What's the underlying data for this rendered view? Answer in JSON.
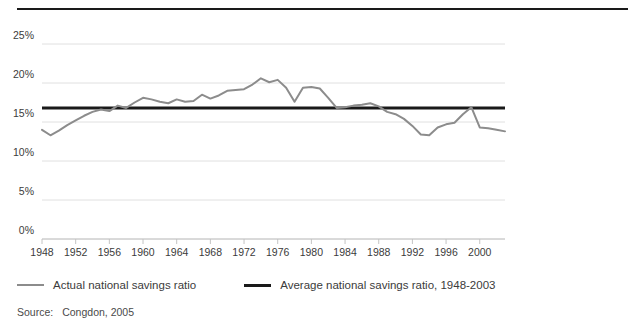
{
  "chart_data": {
    "type": "line",
    "title": "",
    "xlabel": "",
    "ylabel": "",
    "xlim": [
      1948,
      2003
    ],
    "ylim": [
      0,
      25
    ],
    "grid": true,
    "legend_position": "below",
    "y_ticks": [
      "0%",
      "5%",
      "10%",
      "15%",
      "20%",
      "25%"
    ],
    "y_tick_values": [
      0,
      5,
      10,
      15,
      20,
      25
    ],
    "x_ticks": [
      "1948",
      "1952",
      "1956",
      "1960",
      "1964",
      "1968",
      "1972",
      "1976",
      "1980",
      "1984",
      "1988",
      "1992",
      "1996",
      "2000"
    ],
    "x_tick_values": [
      1948,
      1952,
      1956,
      1960,
      1964,
      1968,
      1972,
      1976,
      1980,
      1984,
      1988,
      1992,
      1996,
      2000
    ],
    "series": [
      {
        "name": "Actual national savings ratio",
        "type": "line",
        "color": "#8c8c8c",
        "x": [
          1948,
          1949,
          1950,
          1951,
          1952,
          1953,
          1954,
          1955,
          1956,
          1957,
          1958,
          1959,
          1960,
          1961,
          1962,
          1963,
          1964,
          1965,
          1966,
          1967,
          1968,
          1969,
          1970,
          1971,
          1972,
          1973,
          1974,
          1975,
          1976,
          1977,
          1978,
          1979,
          1980,
          1981,
          1982,
          1983,
          1984,
          1985,
          1986,
          1987,
          1988,
          1989,
          1990,
          1991,
          1992,
          1993,
          1994,
          1995,
          1996,
          1997,
          1998,
          1999,
          2000,
          2001,
          2002,
          2003
        ],
        "values": [
          14.0,
          13.3,
          13.9,
          14.6,
          15.2,
          15.8,
          16.3,
          16.6,
          16.4,
          17.1,
          16.8,
          17.5,
          18.1,
          17.9,
          17.6,
          17.4,
          17.9,
          17.6,
          17.7,
          18.5,
          18.0,
          18.4,
          19.0,
          19.1,
          19.2,
          19.8,
          20.6,
          20.1,
          20.4,
          19.4,
          17.6,
          19.4,
          19.5,
          19.3,
          18.1,
          16.8,
          16.9,
          17.1,
          17.2,
          17.4,
          17.0,
          16.3,
          16.0,
          15.4,
          14.5,
          13.4,
          13.3,
          14.3,
          14.7,
          14.9,
          16.0,
          16.9,
          14.3,
          14.2,
          14.0,
          13.8
        ]
      },
      {
        "name": "Average national savings ratio, 1948-2003",
        "type": "hline",
        "color": "#1a1a1a",
        "value": 16.8
      }
    ]
  },
  "legend": {
    "items": [
      {
        "label": "Actual national savings ratio",
        "color": "#8c8c8c"
      },
      {
        "label": "Average national savings ratio, 1948-2003",
        "color": "#1a1a1a"
      }
    ]
  },
  "source": {
    "label": "Source:",
    "text": "Congdon, 2005"
  }
}
